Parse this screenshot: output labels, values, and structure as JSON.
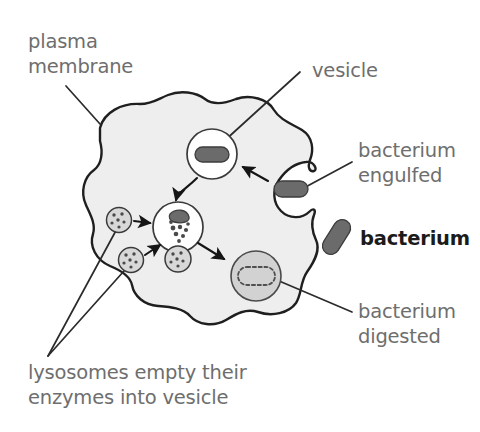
{
  "figure": {
    "background_color": "#ffffff",
    "label_color": "#6e6e6e",
    "key_label_color": "#1b1b1b",
    "membrane_fill": "#eeeeee",
    "membrane_stroke": "#1f1f1f",
    "bacterium_color": "#6b6b6b",
    "lysosome_color": "#d8d8d8",
    "digested_vesicle_color": "#d2d2d2"
  },
  "labels": {
    "plasma_membrane_line1": "plasma",
    "plasma_membrane_line2": "membrane",
    "vesicle": "vesicle",
    "bacterium_engulfed_line1": "bacterium",
    "bacterium_engulfed_line2": "engulfed",
    "bacterium_key": "bacterium",
    "bacterium_digested_line1": "bacterium",
    "bacterium_digested_line2": "digested",
    "lysosomes_caption_line1": "lysosomes empty their",
    "lysosomes_caption_line2": "enzymes into vesicle"
  },
  "structures": {
    "cell": "plasma-membrane-outline",
    "engulfment_pocket": "membrane-invagination-with-bacterium",
    "vesicle_enclosed": "vesicle-containing-intact-bacterium",
    "vesicle_digesting": "vesicle-with-fragmenting-bacterium",
    "vesicle_digested": "vesicle-with-dissolved-bacterium-outline",
    "lysosome_count": 3,
    "free_bacterium": "bacterium-key-glyph"
  },
  "flow_arrows": [
    "engulfed-bacterium-to-vesicle",
    "vesicle-to-digesting-vesicle",
    "lysosome-upper-to-digesting-vesicle",
    "lysosome-lower-to-digesting-vesicle",
    "digesting-vesicle-to-digested-vesicle"
  ]
}
